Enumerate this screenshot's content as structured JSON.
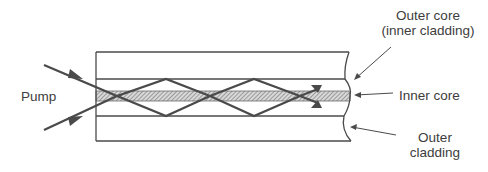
{
  "diagram": {
    "labels": {
      "pump": "Pump",
      "outer_core_line1": "Outer core",
      "outer_core_line2": "(inner cladding)",
      "inner_core": "Inner core",
      "outer_cladding_line1": "Outer",
      "outer_cladding_line2": "cladding"
    },
    "colors": {
      "line": "#4a4a4a",
      "hatch": "#8a8a8a",
      "background": "#ffffff"
    }
  }
}
